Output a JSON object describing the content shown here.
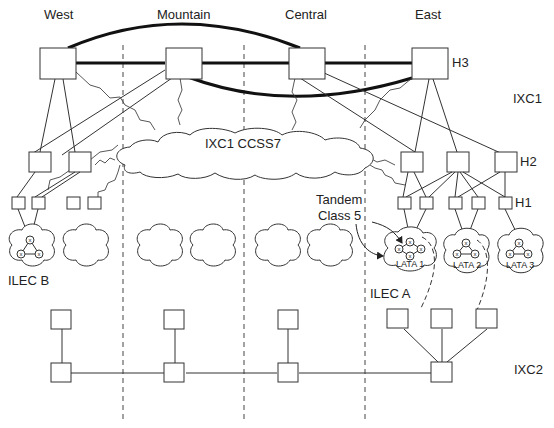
{
  "regions": {
    "west": "West",
    "mountain": "Mountain",
    "central": "Central",
    "east": "East"
  },
  "labels": {
    "h3": "H3",
    "h2": "H2",
    "h1": "H1",
    "ixc1": "IXC1",
    "ixc2": "IXC2",
    "ccss7": "IXC1  CCSS7",
    "tandem_line1": "Tandem",
    "tandem_line2": "Class 5",
    "ilec_a": "ILEC A",
    "ilec_b": "ILEC B",
    "lata1": "LATA 1",
    "lata2": "LATA 2",
    "lata3": "LATA 3"
  },
  "switch_glyph": "x",
  "colors": {
    "line": "#333333",
    "background": "#ffffff"
  }
}
